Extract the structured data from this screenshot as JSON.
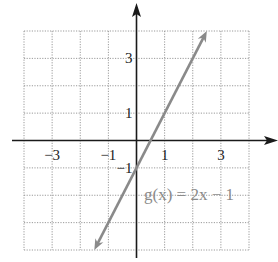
{
  "chart_data": {
    "type": "line",
    "title": "",
    "function_label": "g(x) = 2x − 1",
    "series": [
      {
        "name": "g(x) = 2x - 1",
        "x": [
          -1.5,
          2.5
        ],
        "y": [
          -4,
          4
        ],
        "color": "#8a8a8a",
        "arrows": "both"
      }
    ],
    "xlim": [
      -4,
      4
    ],
    "ylim": [
      -4,
      4
    ],
    "grid": true,
    "x_tick_labels": [
      {
        "value": -3,
        "label": "−3"
      },
      {
        "value": -1,
        "label": "−1"
      },
      {
        "value": 1,
        "label": "1"
      },
      {
        "value": 3,
        "label": "3"
      }
    ],
    "y_tick_labels": [
      {
        "value": 3,
        "label": "3"
      },
      {
        "value": 1,
        "label": "1"
      },
      {
        "value": -1,
        "label": "−1"
      }
    ],
    "xlabel": "",
    "ylabel": ""
  },
  "colors": {
    "axis": "#1a1a1a",
    "grid": "#9a9a9a",
    "line": "#8a8a8a"
  }
}
